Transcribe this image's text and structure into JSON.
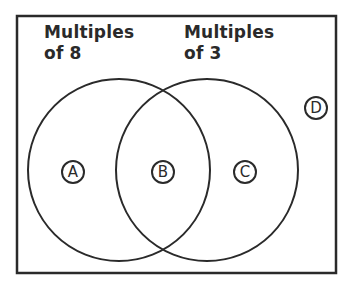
{
  "diagram": {
    "type": "venn",
    "sets": [
      {
        "id": "set-8",
        "label_line1": "Multiples",
        "label_line2": "of 8"
      },
      {
        "id": "set-3",
        "label_line1": "Multiples",
        "label_line2": "of 3"
      }
    ],
    "regions": [
      {
        "label": "A",
        "meaning": "only multiples of 8"
      },
      {
        "label": "B",
        "meaning": "multiples of 8 and 3"
      },
      {
        "label": "C",
        "meaning": "only multiples of 3"
      },
      {
        "label": "D",
        "meaning": "neither"
      }
    ],
    "colors": {
      "stroke": "#2a2a2a",
      "background": "#ffffff"
    }
  }
}
